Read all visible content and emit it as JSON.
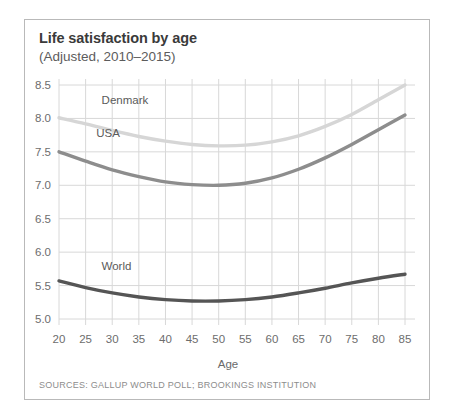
{
  "card": {
    "title": "Life satisfaction by age",
    "subtitle": "(Adjusted, 2010–2015)",
    "sources": "SOURCES: GALLUP WORLD POLL; BROOKINGS INSTITUTION"
  },
  "chart_data": {
    "type": "line",
    "title": "Life satisfaction by age",
    "subtitle": "(Adjusted, 2010–2015)",
    "xlabel": "Age",
    "ylabel": "",
    "xlim": [
      20,
      85
    ],
    "ylim": [
      5.0,
      8.5
    ],
    "grid": true,
    "legend": "inline-labels",
    "xticks": [
      20,
      25,
      30,
      35,
      40,
      45,
      50,
      55,
      60,
      65,
      70,
      75,
      80,
      85
    ],
    "xticklabels": [
      "20",
      "25",
      "30",
      "35",
      "40",
      "45",
      "50",
      "55",
      "60",
      "65",
      "70",
      "75",
      "80",
      "85"
    ],
    "yticks": [
      5.0,
      5.5,
      6.0,
      6.5,
      7.0,
      7.5,
      8.0,
      8.5
    ],
    "yticklabels": [
      "5.0",
      "5.5",
      "6.0",
      "6.5",
      "7.0",
      "7.5",
      "8.0",
      "8.5"
    ],
    "x": [
      20,
      25,
      30,
      35,
      40,
      45,
      50,
      55,
      60,
      65,
      70,
      75,
      80,
      85
    ],
    "series": [
      {
        "name": "Denmark",
        "color": "#d6d6d6",
        "label_x": 28,
        "label_y": 8.22,
        "values": [
          8.01,
          7.92,
          7.82,
          7.73,
          7.66,
          7.61,
          7.59,
          7.6,
          7.65,
          7.74,
          7.88,
          8.06,
          8.28,
          8.5
        ]
      },
      {
        "name": "USA",
        "color": "#8d8d8d",
        "label_x": 27,
        "label_y": 7.72,
        "values": [
          7.5,
          7.36,
          7.23,
          7.13,
          7.05,
          7.01,
          7.0,
          7.03,
          7.11,
          7.24,
          7.41,
          7.61,
          7.83,
          8.05
        ]
      },
      {
        "name": "World",
        "color": "#555555",
        "label_x": 28,
        "label_y": 5.74,
        "values": [
          5.57,
          5.47,
          5.39,
          5.33,
          5.29,
          5.27,
          5.27,
          5.29,
          5.33,
          5.39,
          5.46,
          5.54,
          5.61,
          5.67
        ]
      }
    ]
  }
}
